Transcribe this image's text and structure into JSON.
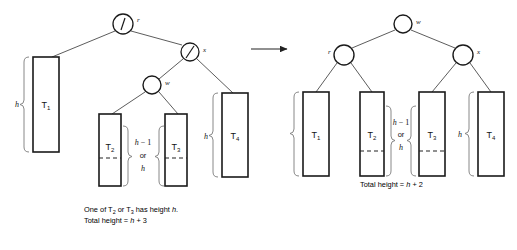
{
  "figure": {
    "type": "avl-rotation-diagram",
    "transform_arrow": "→",
    "colors": {
      "ink": "#1a1a1a",
      "line": "#444444",
      "brace": "#777777",
      "dashed": "#333333"
    }
  },
  "left_tree": {
    "nodes": [
      {
        "id": "root",
        "label": "r",
        "marker": "tick",
        "cx": 123,
        "cy": 24,
        "r": 10
      },
      {
        "id": "x",
        "label": "x",
        "marker": "slash",
        "cx": 190,
        "cy": 52,
        "r": 9
      },
      {
        "id": "w",
        "label": "w",
        "marker": "none",
        "cx": 152,
        "cy": 85,
        "r": 9
      }
    ],
    "subtrees": [
      {
        "label": "T",
        "sub": "1",
        "x": 33,
        "y": 57,
        "w": 26,
        "h": 95,
        "dashed": false
      },
      {
        "label": "T",
        "sub": "2",
        "x": 99,
        "y": 114,
        "w": 22,
        "h": 72,
        "dashed": true,
        "dash_y": 158
      },
      {
        "label": "T",
        "sub": "3",
        "x": 165,
        "y": 114,
        "w": 22,
        "h": 72,
        "dashed": true,
        "dash_y": 158
      },
      {
        "label": "T",
        "sub": "4",
        "x": 222,
        "y": 93,
        "w": 26,
        "h": 84,
        "dashed": false
      }
    ],
    "braces": [
      {
        "id": "h-T1",
        "label": "h",
        "x": 24,
        "top": 57,
        "bottom": 152
      },
      {
        "id": "h-T4",
        "label": "h",
        "x": 213,
        "top": 93,
        "bottom": 177
      },
      {
        "id": "mid-left",
        "side": "right",
        "x": 126,
        "top": 126,
        "bottom": 186
      },
      {
        "id": "mid-right",
        "side": "left",
        "x": 160,
        "top": 126,
        "bottom": 186
      }
    ],
    "middle_label": {
      "line1": "h − 1",
      "line2": "or",
      "line3": "h"
    },
    "caption": {
      "line1_pre": "One of T",
      "line1_sub1": "2",
      "line1_mid": " or T",
      "line1_sub2": "3",
      "line1_post": " has height ",
      "line1_var": "h",
      "line1_end": ".",
      "line2_pre": "Total height = ",
      "line2_var": "h",
      "line2_post": " + 3"
    }
  },
  "right_tree": {
    "nodes": [
      {
        "id": "root",
        "label": "w",
        "marker": "none",
        "cx": 403,
        "cy": 24,
        "r": 9
      },
      {
        "id": "r",
        "label": "r",
        "marker": "none",
        "cx": 344,
        "cy": 55,
        "r": 10,
        "label_side": "left"
      },
      {
        "id": "x",
        "label": "x",
        "marker": "none",
        "cx": 463,
        "cy": 55,
        "r": 10
      }
    ],
    "subtrees": [
      {
        "label": "T",
        "sub": "1",
        "x": 303,
        "y": 92,
        "w": 26,
        "h": 84,
        "dashed": false
      },
      {
        "label": "T",
        "sub": "2",
        "x": 360,
        "y": 92,
        "w": 24,
        "h": 84,
        "dashed": true,
        "dash_y": 151
      },
      {
        "label": "T",
        "sub": "3",
        "x": 419,
        "y": 92,
        "w": 26,
        "h": 84,
        "dashed": true,
        "dash_y": 151
      },
      {
        "label": "T",
        "sub": "4",
        "x": 478,
        "y": 92,
        "w": 26,
        "h": 84,
        "dashed": false
      }
    ],
    "braces": [
      {
        "id": "h-T1",
        "side": "left",
        "x": 295,
        "top": 92,
        "bottom": 176
      },
      {
        "id": "mid-left",
        "side": "right",
        "x": 389,
        "top": 106,
        "bottom": 176
      },
      {
        "id": "mid-right",
        "side": "left",
        "x": 412,
        "top": 106,
        "bottom": 176
      },
      {
        "id": "h-T4",
        "label": "h",
        "x": 469,
        "top": 92,
        "bottom": 176
      }
    ],
    "middle_label": {
      "line1": "h − 1",
      "line2": "or",
      "line3": "h"
    },
    "caption": {
      "line2_pre": "Total height = ",
      "line2_var": "h",
      "line2_post": " + 2"
    }
  }
}
